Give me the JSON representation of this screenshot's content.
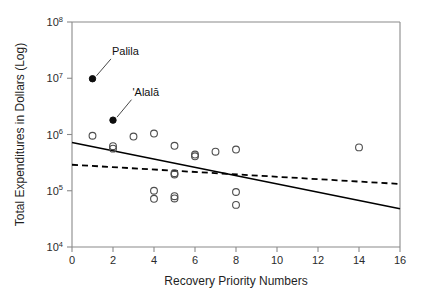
{
  "chart_data": {
    "type": "scatter",
    "title": "",
    "xlabel": "Recovery Priority Numbers",
    "ylabel": "Total Expenditures in Dollars (Log)",
    "xlim": [
      0,
      16
    ],
    "ylim": [
      10000,
      100000000
    ],
    "yscale": "log",
    "grid": false,
    "legend": "none",
    "xticks": [
      "0",
      "2",
      "4",
      "6",
      "8",
      "10",
      "12",
      "14",
      "16"
    ],
    "xtick_values": [
      0,
      2,
      4,
      6,
      8,
      10,
      12,
      14,
      16
    ],
    "yticks": [
      "10^4",
      "10^5",
      "10^6",
      "10^7",
      "10^8"
    ],
    "ytick_values": [
      10000,
      100000,
      1000000,
      10000000,
      100000000
    ],
    "ytick_mantissa": [
      "10",
      "10",
      "10",
      "10",
      "10"
    ],
    "ytick_exponent": [
      "4",
      "5",
      "6",
      "7",
      "8"
    ],
    "series": [
      {
        "name": "highlighted-species",
        "marker": "filled-circle",
        "color": "#0d0d0d",
        "points": [
          {
            "x": 1,
            "y": 9800000,
            "label": "Palila"
          },
          {
            "x": 2,
            "y": 1800000,
            "label": "'Alalā"
          }
        ]
      },
      {
        "name": "other-species",
        "marker": "open-circle",
        "color": "#4d4d4d",
        "points": [
          {
            "x": 1,
            "y": 950000
          },
          {
            "x": 2,
            "y": 620000
          },
          {
            "x": 2,
            "y": 560000
          },
          {
            "x": 3,
            "y": 920000
          },
          {
            "x": 4,
            "y": 1040000
          },
          {
            "x": 4,
            "y": 100000
          },
          {
            "x": 4,
            "y": 72000
          },
          {
            "x": 5,
            "y": 630000
          },
          {
            "x": 5,
            "y": 205000
          },
          {
            "x": 5,
            "y": 195000
          },
          {
            "x": 5,
            "y": 80000
          },
          {
            "x": 5,
            "y": 73000
          },
          {
            "x": 6,
            "y": 440000
          },
          {
            "x": 6,
            "y": 410000
          },
          {
            "x": 7,
            "y": 495000
          },
          {
            "x": 8,
            "y": 540000
          },
          {
            "x": 8,
            "y": 95000
          },
          {
            "x": 8,
            "y": 56000
          },
          {
            "x": 14,
            "y": 590000
          }
        ]
      }
    ],
    "trend_lines": [
      {
        "name": "solid-regression-line",
        "style": "solid",
        "color": "#000000",
        "x0": 0,
        "y0": 720000,
        "x1": 16,
        "y1": 48000
      },
      {
        "name": "dashed-regression-line",
        "style": "dashed",
        "color": "#000000",
        "x0": 0,
        "y0": 290000,
        "x1": 16,
        "y1": 132000
      }
    ],
    "annotations": [
      {
        "name": "palila-annotation",
        "text": "Palila",
        "text_x": 1.95,
        "text_y": 26000000,
        "point_x": 1,
        "point_y": 9800000
      },
      {
        "name": "alala-annotation",
        "text": "'Alalā",
        "text_x": 2.95,
        "text_y": 4900000,
        "point_x": 2,
        "point_y": 1800000
      }
    ]
  }
}
